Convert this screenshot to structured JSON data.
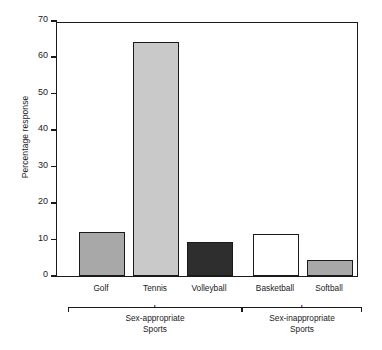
{
  "chart_data": {
    "type": "bar",
    "title": "",
    "xlabel": "",
    "ylabel": "Percentage response",
    "ylim": [
      0,
      70
    ],
    "yticks": [
      0,
      10,
      20,
      30,
      40,
      50,
      60,
      70
    ],
    "grid": false,
    "legend": false,
    "categories": [
      "Golf",
      "Tennis",
      "Volleyball",
      "Basketball",
      "Softball"
    ],
    "values": [
      12.2,
      64.3,
      9.3,
      11.5,
      4.3
    ],
    "bar_colors": [
      "#a8a8a8",
      "#c9c9c9",
      "#2e2e2e",
      "#ffffff",
      "#a8a8a8"
    ],
    "groups": [
      {
        "label": "Sex-appropriate\nSports",
        "label_line1": "Sex-appropriate",
        "label_line2": "Sports",
        "members": [
          "Golf",
          "Tennis",
          "Volleyball"
        ]
      },
      {
        "label": "Sex-inappropriate\nSports",
        "label_line1": "Sex-inappropriate",
        "label_line2": "Sports",
        "members": [
          "Basketball",
          "Softball"
        ]
      }
    ],
    "axis_color": "#1a1a1a",
    "background": "#ffffff"
  },
  "ylabel_text": "Percentage response",
  "ytick_labels": [
    "0",
    "10",
    "20",
    "30",
    "40",
    "50",
    "60",
    "70"
  ],
  "cat_labels": [
    "Golf",
    "Tennis",
    "Volleyball",
    "Basketball",
    "Softball"
  ],
  "group1": {
    "line1": "Sex-appropriate",
    "line2": "Sports"
  },
  "group2": {
    "line1": "Sex-inappropriate",
    "line2": "Sports"
  }
}
